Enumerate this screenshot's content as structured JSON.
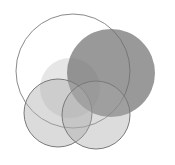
{
  "diagram": {
    "type": "overlapping-circles",
    "background": "#ffffff",
    "circles": [
      {
        "id": "large-outline",
        "cx": 73,
        "cy": 71,
        "r": 57,
        "fill": "none",
        "stroke": "#8a8a8a",
        "opacity": 1
      },
      {
        "id": "light-center",
        "cx": 70,
        "cy": 88,
        "r": 30,
        "fill": "#c8c8c8",
        "stroke": "none",
        "opacity": 0.45
      },
      {
        "id": "dark-right",
        "cx": 111,
        "cy": 73,
        "r": 44,
        "fill": "#6e6e6e",
        "stroke": "none",
        "opacity": 0.7
      },
      {
        "id": "bottom-left",
        "cx": 58,
        "cy": 113,
        "r": 34,
        "fill": "#b0b0b0",
        "stroke": "#7a7a7a",
        "opacity": 0.45
      },
      {
        "id": "bottom-right",
        "cx": 96,
        "cy": 115,
        "r": 34,
        "fill": "#a8a8a8",
        "stroke": "#7a7a7a",
        "opacity": 0.4
      }
    ]
  }
}
